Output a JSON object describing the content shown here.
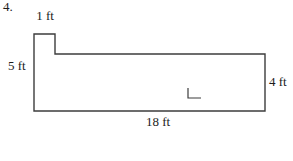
{
  "problem": {
    "number": "4."
  },
  "figure": {
    "type": "composite-rectangle-diagram",
    "unit": "ft",
    "labels": {
      "notch_width": "1 ft",
      "left_height": "5 ft",
      "right_height": "4 ft",
      "bottom_width": "18 ft"
    },
    "dimensions": {
      "notch_width_ft": 1,
      "left_height_ft": 5,
      "right_height_ft": 4,
      "bottom_width_ft": 18
    },
    "line_color": "#3d3d3d",
    "background_color": "#ffffff",
    "has_right_angle_mark": true
  }
}
